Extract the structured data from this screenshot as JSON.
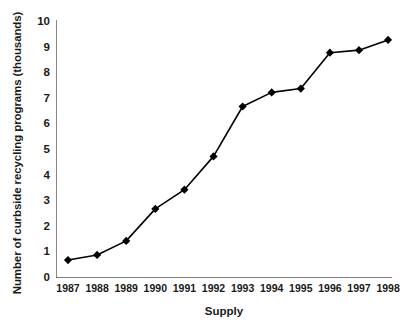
{
  "chart_data": {
    "type": "line",
    "title": "",
    "xlabel": "Supply",
    "ylabel": "Number of curbside recycling programs (thousands)",
    "categories": [
      "1987",
      "1988",
      "1989",
      "1990",
      "1991",
      "1992",
      "1993",
      "1994",
      "1995",
      "1996",
      "1997",
      "1998"
    ],
    "values": [
      0.7,
      0.9,
      1.45,
      2.7,
      3.45,
      4.75,
      6.7,
      7.25,
      7.4,
      8.8,
      8.9,
      9.3
    ],
    "series": [
      {
        "name": "Number of curbside recycling programs (thousands)",
        "values": [
          0.7,
          0.9,
          1.45,
          2.7,
          3.45,
          4.75,
          6.7,
          7.25,
          7.4,
          8.8,
          8.9,
          9.3
        ]
      }
    ],
    "ylim": [
      0,
      10
    ],
    "yticks": [
      0,
      1,
      2,
      3,
      4,
      5,
      6,
      7,
      8,
      9,
      10
    ],
    "ytick_labels": [
      "0",
      "1",
      "2",
      "3",
      "4",
      "5",
      "6",
      "7",
      "8",
      "9",
      "10"
    ],
    "xtick_labels": [
      "1987",
      "1988",
      "1989",
      "1990",
      "1991",
      "1992",
      "1993",
      "1994",
      "1995",
      "1996",
      "1997",
      "1998"
    ],
    "grid": false,
    "legend": "none",
    "marker": "diamond",
    "line_color": "#000000",
    "marker_color": "#000000",
    "axis_color": "#555555",
    "background": "#ffffff"
  }
}
